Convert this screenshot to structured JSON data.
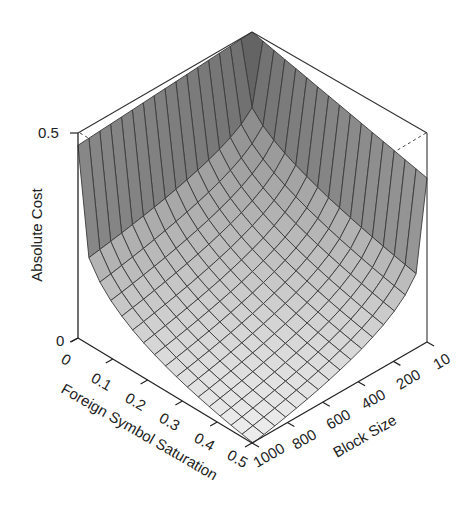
{
  "chart_data": {
    "type": "surface",
    "title": "",
    "xlabel": "Foreign Symbol Saturation",
    "ylabel": "Block Size",
    "zlabel": "Absolute Cost",
    "x_ticks": [
      "0",
      "0.1",
      "0.2",
      "0.3",
      "0.4",
      "0.5"
    ],
    "x_tick_values": [
      0,
      0.1,
      0.2,
      0.3,
      0.4,
      0.5
    ],
    "y_ticks": [
      "1000",
      "800",
      "600",
      "400",
      "200",
      "10"
    ],
    "y_tick_values": [
      1000,
      800,
      600,
      400,
      200,
      10
    ],
    "z_ticks": [
      "0",
      "0.5"
    ],
    "z_tick_values": [
      0,
      0.5
    ],
    "xlim": [
      0,
      0.5
    ],
    "ylim": [
      10,
      1000
    ],
    "zlim": [
      0,
      0.5
    ],
    "grid": false,
    "legend": null,
    "colormap": "grayscale (dark = high cost, light = low cost)",
    "surface_samples": [
      {
        "saturation": 0.0,
        "block_size": 10,
        "cost": 0.5
      },
      {
        "saturation": 0.0,
        "block_size": 1000,
        "cost": 0.47
      },
      {
        "saturation": 0.5,
        "block_size": 10,
        "cost": 0.4
      },
      {
        "saturation": 0.5,
        "block_size": 1000,
        "cost": 0.0
      },
      {
        "saturation": 0.1,
        "block_size": 1000,
        "cost": 0.05
      },
      {
        "saturation": 0.5,
        "block_size": 200,
        "cost": 0.06
      },
      {
        "saturation": 0.25,
        "block_size": 500,
        "cost": 0.07
      }
    ]
  },
  "labels": {
    "z_title": "Absolute Cost",
    "x_title": "Foreign Symbol Saturation",
    "y_title": "Block Size",
    "z_tick_0": "0",
    "z_tick_05": "0.5",
    "x_tick_0": "0",
    "x_tick_1": "0.1",
    "x_tick_2": "0.2",
    "x_tick_3": "0.3",
    "x_tick_4": "0.4",
    "x_tick_5": "0.5",
    "y_tick_1000": "1000",
    "y_tick_800": "800",
    "y_tick_600": "600",
    "y_tick_400": "400",
    "y_tick_200": "200",
    "y_tick_10": "10"
  }
}
